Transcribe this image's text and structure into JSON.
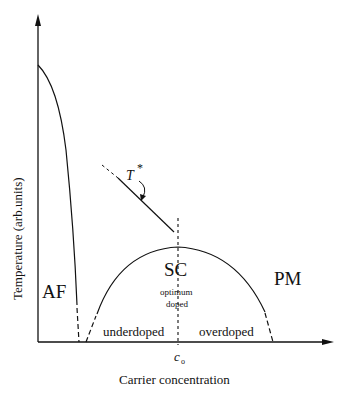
{
  "diagram": {
    "type": "phase-diagram",
    "x_axis_label": "Carrier concentration",
    "y_axis_label": "Temperature (arb.units)",
    "x_marker": "c",
    "x_marker_sub": "o",
    "regions": {
      "af": "AF",
      "sc": "SC",
      "pm": "PM",
      "optimum_line1": "optimum",
      "optimum_line2": "doped",
      "underdoped": "underdoped",
      "overdoped": "overdoped"
    },
    "pseudogap_label": "T",
    "pseudogap_sup": "*"
  }
}
